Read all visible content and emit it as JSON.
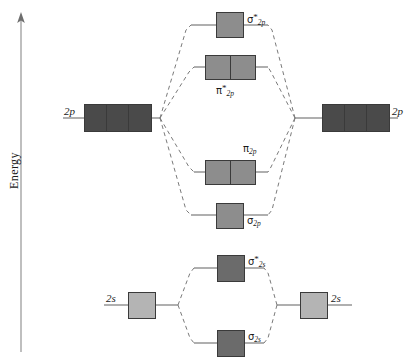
{
  "figure": {
    "type": "molecular-orbital-energy-diagram",
    "axis": {
      "label": "Energy",
      "direction": "up"
    }
  },
  "colors": {
    "atomic_2p_fill": "#4a4a4a",
    "atomic_2s_fill": "#b4b4b4",
    "mo_2p_fill": "#8d8d8d",
    "mo_2s_fill": "#6b6b6b",
    "box_stroke": "#3a3a3a",
    "solid_line": "#6e6e6e",
    "dashed_line": "#7a7a7a",
    "text": "#1a1a1a",
    "background": "#ffffff"
  },
  "atomic_orbitals": {
    "left_2p": {
      "label": "2p",
      "boxes": 3
    },
    "right_2p": {
      "label": "2p",
      "boxes": 3
    },
    "left_2s": {
      "label": "2s",
      "boxes": 1
    },
    "right_2s": {
      "label": "2s",
      "boxes": 1
    }
  },
  "molecular_orbitals": [
    {
      "key": "sigma_star_2p",
      "symbol": "σ",
      "star": "*",
      "sub": "2p",
      "boxes": 1,
      "group": "2p"
    },
    {
      "key": "pi_star_2p",
      "symbol": "π",
      "star": "*",
      "sub": "2p",
      "boxes": 2,
      "group": "2p"
    },
    {
      "key": "pi_2p",
      "symbol": "π",
      "star": "",
      "sub": "2p",
      "boxes": 2,
      "group": "2p"
    },
    {
      "key": "sigma_2p",
      "symbol": "σ",
      "star": "",
      "sub": "2p",
      "boxes": 1,
      "group": "2p"
    },
    {
      "key": "sigma_star_2s",
      "symbol": "σ",
      "star": "*",
      "sub": "2s",
      "boxes": 1,
      "group": "2s"
    },
    {
      "key": "sigma_2s",
      "symbol": "σ",
      "star": "",
      "sub": "2s",
      "boxes": 1,
      "group": "2s"
    }
  ],
  "labels": {
    "sigma_star_2p_sym": "σ",
    "sigma_star_2p_star": "*",
    "sigma_star_2p_sub": "2p",
    "pi_star_2p_sym": "π",
    "pi_star_2p_star": "*",
    "pi_star_2p_sub": "2p",
    "pi_2p_sym": "π",
    "pi_2p_sub": "2p",
    "sigma_2p_sym": "σ",
    "sigma_2p_sub": "2p",
    "sigma_star_2s_sym": "σ",
    "sigma_star_2s_star": "*",
    "sigma_star_2s_sub": "2s",
    "sigma_2s_sym": "σ",
    "sigma_2s_sub": "2s",
    "left_2p": "2p",
    "right_2p": "2p",
    "left_2s": "2s",
    "right_2s": "2s",
    "energy": "Energy"
  }
}
